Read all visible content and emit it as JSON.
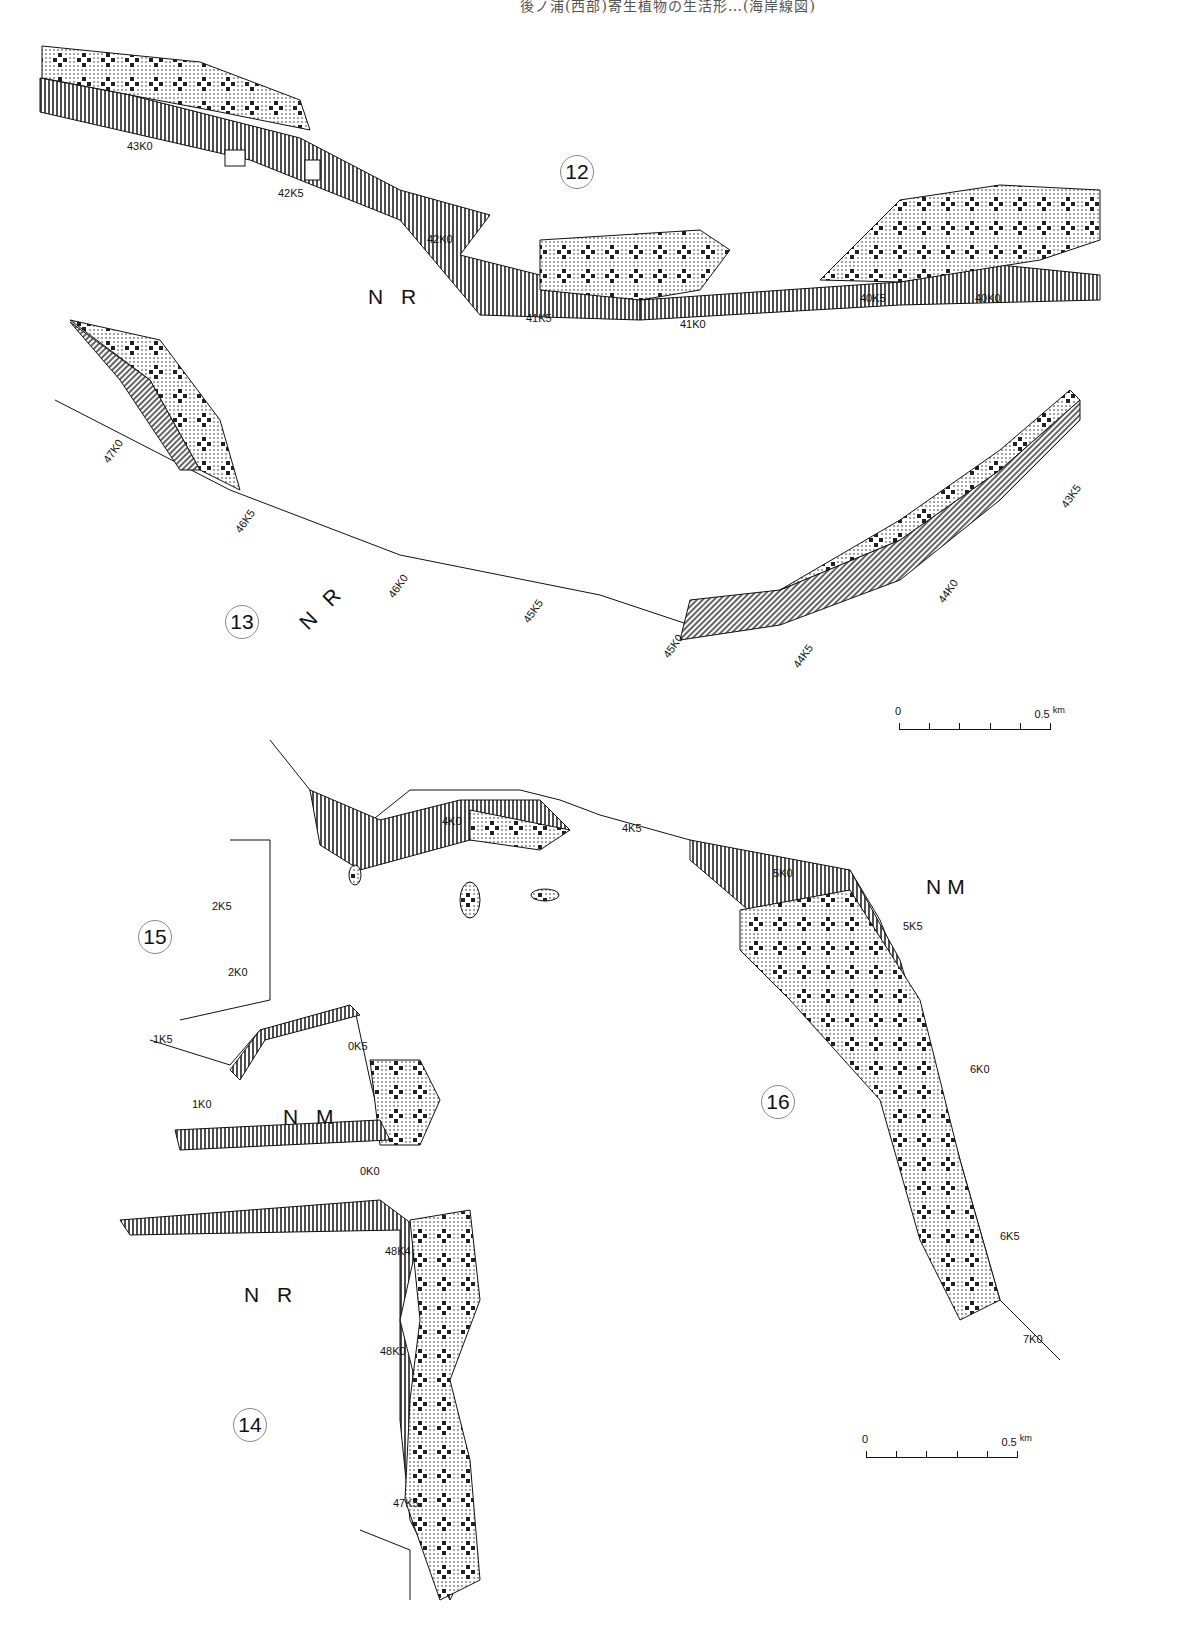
{
  "header": {
    "text": "後ノ浦(西部)寄生植物の生活形…(海岸線図)"
  },
  "map": {
    "sections": [
      {
        "id": "12",
        "label": "12"
      },
      {
        "id": "13",
        "label": "13"
      },
      {
        "id": "14",
        "label": "14"
      },
      {
        "id": "15",
        "label": "15"
      },
      {
        "id": "16",
        "label": "16"
      }
    ],
    "regions": [
      {
        "name": "NR-12",
        "label": "N R"
      },
      {
        "name": "NR-13",
        "label": "N R"
      },
      {
        "name": "NM-16",
        "label": "NM"
      },
      {
        "name": "NM-15",
        "label": "N M"
      },
      {
        "name": "NR-14",
        "label": "N R"
      }
    ],
    "km_markers": {
      "section12": [
        "43K0",
        "42K5",
        "42K0",
        "41K5",
        "41K0",
        "40K5",
        "40K0"
      ],
      "section13": [
        "47K0",
        "46K5",
        "46K0",
        "45K5",
        "45K0",
        "44K5",
        "44K0",
        "43K5"
      ],
      "section15": [
        "2K5",
        "2K0",
        "1K5",
        "1K0",
        "0K5",
        "0K0"
      ],
      "section16": [
        "4K0",
        "4K5",
        "5K0",
        "5K5",
        "6K0",
        "6K5",
        "7K0"
      ],
      "section14": [
        "48K4",
        "48K0",
        "47K5"
      ]
    },
    "scale_bars": [
      {
        "start": "0",
        "end": "0.5",
        "unit": "km"
      },
      {
        "start": "0",
        "end": "0.5",
        "unit": "km"
      }
    ]
  }
}
